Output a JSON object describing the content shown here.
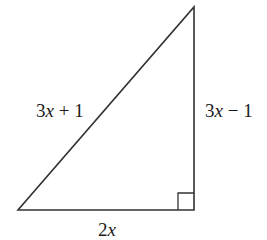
{
  "figure": {
    "type": "right-triangle",
    "marker": ")",
    "vertices": {
      "bottom_left": [
        18,
        210
      ],
      "bottom_right": [
        194,
        210
      ],
      "apex": [
        194,
        7
      ]
    },
    "right_angle_at": "bottom_right",
    "line_color": "#333333",
    "labels": {
      "hypotenuse": "3x + 1",
      "vertical_leg": "3x − 1",
      "base": "2x"
    }
  }
}
